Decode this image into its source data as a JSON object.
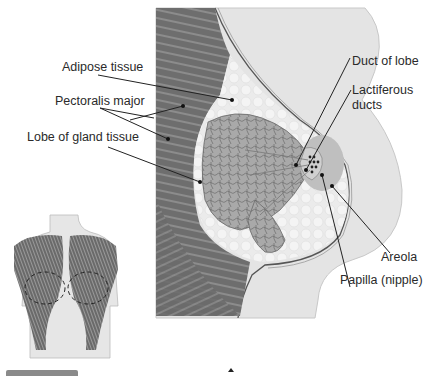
{
  "figure": {
    "type": "anatomical-diagram",
    "colors": {
      "muscle": "#6e6e6e",
      "muscle_light": "#9a9a9a",
      "skin": "#d9d9d9",
      "skin_outer": "#e6e6e6",
      "adipose": "#eeeeee",
      "gland": "#a8a8a8",
      "areola": "#bdbdbd",
      "line": "#333333"
    },
    "labels": {
      "adipose": "Adipose tissue",
      "pectoralis": "Pectoralis major",
      "lobe": "Lobe of gland tissue",
      "duct_of_lobe": "Duct of lobe",
      "lactiferous_1": "Lactiferous",
      "lactiferous_2": "ducts",
      "areola": "Areola",
      "papilla": "Papilla (nipple)"
    },
    "inset": {
      "subject": "Torso front view with pectoralis major muscles; dashed outlines mark breast position"
    }
  }
}
